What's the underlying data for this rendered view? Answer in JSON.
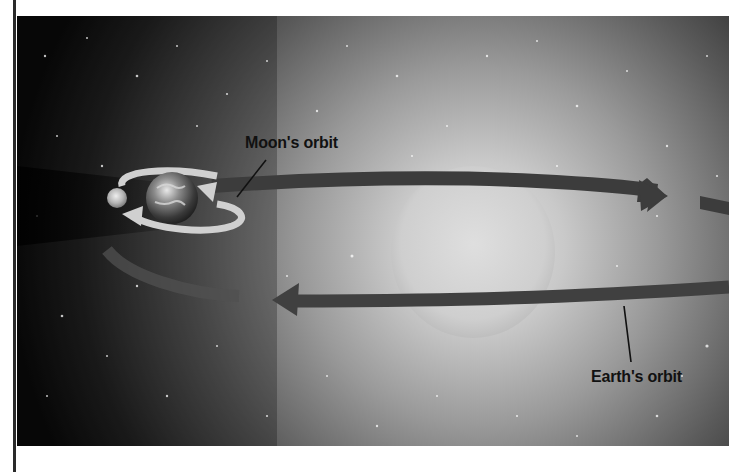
{
  "diagram": {
    "labels": {
      "moon_orbit": "Moon's orbit",
      "earth_orbit": "Earth's orbit"
    },
    "bodies": [
      {
        "name": "Sun",
        "role": "central glowing star"
      },
      {
        "name": "Earth",
        "role": "planet orbiting the Sun"
      },
      {
        "name": "Moon",
        "role": "satellite orbiting Earth"
      }
    ],
    "colors": {
      "space_dark": "#0b0b0b",
      "sun_glow": "#d8d8d8",
      "orbit_arrow": "#3e3e3e",
      "moon_orbit_arrow": "#cfcfcf",
      "label_text": "#111111"
    }
  }
}
